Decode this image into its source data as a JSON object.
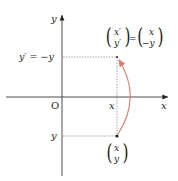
{
  "diagram": {
    "axis_labels": {
      "x": "x",
      "y": "y",
      "origin": "O"
    },
    "left_labels": {
      "top": "y′ = −y",
      "bottom": "y"
    },
    "x_tick_label": "x",
    "top_vector": {
      "lhs_top": "x′",
      "lhs_bottom": "y′",
      "equals": "=",
      "rhs_top": "x",
      "rhs_bottom": "−y"
    },
    "bottom_vector": {
      "top": "x",
      "bottom": "y"
    },
    "colors": {
      "axis": "#231f20",
      "arc": "#e07a6a",
      "dashed": "#6d6e71"
    }
  }
}
